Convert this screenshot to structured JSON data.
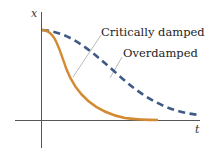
{
  "diagram": {
    "title": "",
    "axes": {
      "x_label": "t",
      "y_label": "x"
    },
    "curves": [
      {
        "name": "Critically damped",
        "style": "solid",
        "color": "#d48a32"
      },
      {
        "name": "Overdamped",
        "style": "dashed",
        "color": "#3e5a85"
      }
    ],
    "labels": {
      "critically_damped": "Critically damped",
      "overdamped": "Overdamped"
    },
    "colors": {
      "axis": "#555555",
      "leader": "#a8a8a8"
    }
  }
}
